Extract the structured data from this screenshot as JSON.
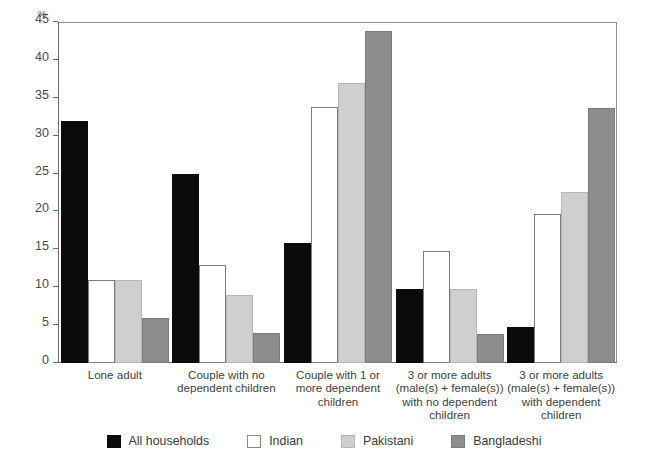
{
  "chart_data": {
    "type": "bar",
    "title": "",
    "xlabel": "",
    "ylabel": "%",
    "ylim": [
      0,
      45
    ],
    "yticks": [
      0,
      5,
      10,
      15,
      20,
      25,
      30,
      35,
      40,
      45
    ],
    "grid": false,
    "legend_position": "bottom",
    "categories": [
      "Lone adult",
      "Couple with no\ndependent children",
      "Couple with 1 or\nmore dependent\nchildren",
      "3 or more adults\n(male(s) + female(s))\nwith no dependent\nchildren",
      "3 or more adults\n(male(s) + female(s))\nwith dependent\nchildren"
    ],
    "category_lines": [
      [
        "Lone adult"
      ],
      [
        "Couple with no",
        "dependent children"
      ],
      [
        "Couple with 1 or",
        "more dependent",
        "children"
      ],
      [
        "3 or more adults",
        "(male(s) + female(s))",
        "with no dependent",
        "children"
      ],
      [
        "3 or more adults",
        "(male(s) + female(s))",
        "with dependent",
        "children"
      ]
    ],
    "series": [
      {
        "name": "All households",
        "color": "#0b0b0b",
        "values": [
          32.0,
          25.0,
          15.8,
          9.8,
          4.7
        ]
      },
      {
        "name": "Indian",
        "color": "#ffffff",
        "values": [
          11.0,
          13.0,
          33.8,
          14.8,
          19.7
        ]
      },
      {
        "name": "Pakistani",
        "color": "#cfcfcf",
        "values": [
          11.0,
          9.0,
          36.9,
          9.8,
          22.6
        ]
      },
      {
        "name": "Bangladeshi",
        "color": "#8d8d8d",
        "values": [
          6.0,
          4.0,
          43.8,
          3.8,
          33.6
        ]
      }
    ]
  },
  "axis": {
    "percent_symbol": "%",
    "tick_labels": [
      "0",
      "5",
      "10",
      "15",
      "20",
      "25",
      "30",
      "35",
      "40",
      "45"
    ]
  },
  "legend": {
    "items": [
      {
        "label": "All households",
        "swatch": "black-swatch"
      },
      {
        "label": "Indian",
        "swatch": "white-swatch"
      },
      {
        "label": "Pakistani",
        "swatch": "light-gray-swatch"
      },
      {
        "label": "Bangladeshi",
        "swatch": "dark-gray-swatch"
      }
    ]
  }
}
